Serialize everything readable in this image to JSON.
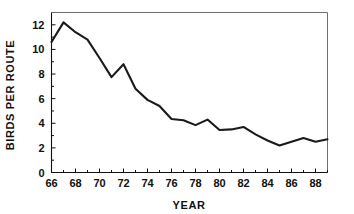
{
  "chart_data": {
    "type": "line",
    "title": "",
    "xlabel": "YEAR",
    "ylabel": "BIRDS PER ROUTE",
    "xlim": [
      66,
      89
    ],
    "ylim": [
      0,
      13
    ],
    "grid": false,
    "legend": false,
    "x": [
      66,
      67,
      68,
      69,
      70,
      71,
      72,
      73,
      74,
      75,
      76,
      77,
      78,
      79,
      80,
      81,
      82,
      83,
      84,
      85,
      86,
      87,
      88,
      89
    ],
    "values": [
      10.6,
      12.2,
      11.4,
      10.8,
      9.3,
      7.75,
      8.8,
      6.8,
      5.9,
      5.4,
      4.35,
      4.25,
      3.85,
      4.3,
      3.45,
      3.5,
      3.7,
      3.1,
      2.6,
      2.2,
      2.5,
      2.8,
      2.5,
      2.7
    ],
    "series": [
      {
        "name": "birds-per-route",
        "values": [
          10.6,
          12.2,
          11.4,
          10.8,
          9.3,
          7.75,
          8.8,
          6.8,
          5.9,
          5.4,
          4.35,
          4.25,
          3.85,
          4.3,
          3.45,
          3.5,
          3.7,
          3.1,
          2.6,
          2.2,
          2.5,
          2.8,
          2.5,
          2.7
        ]
      }
    ],
    "x_tick_labels": [
      "66",
      "68",
      "70",
      "72",
      "74",
      "76",
      "78",
      "80",
      "82",
      "84",
      "86",
      "88"
    ],
    "x_tick_values": [
      66,
      68,
      70,
      72,
      74,
      76,
      78,
      80,
      82,
      84,
      86,
      88
    ],
    "x_minor_ticks": [
      67,
      69,
      71,
      73,
      75,
      77,
      79,
      81,
      83,
      85,
      87,
      89
    ],
    "y_tick_labels": [
      "0",
      "2",
      "4",
      "6",
      "8",
      "10",
      "12"
    ],
    "y_tick_values": [
      0,
      2,
      4,
      6,
      8,
      10,
      12
    ],
    "line_color": "#1a1a1a",
    "axis_color": "#111111",
    "frame_color": "#6f6f6f",
    "background_color": "#ffffff"
  }
}
